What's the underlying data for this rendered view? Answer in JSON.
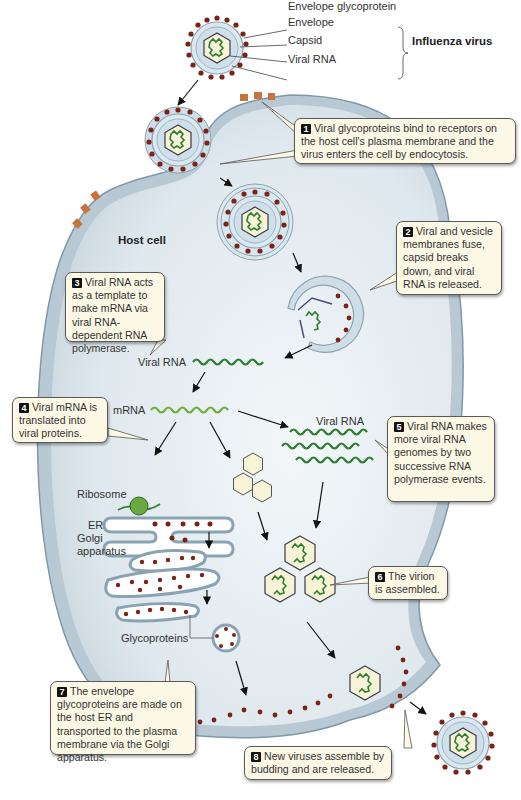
{
  "virus_legend": {
    "parts": [
      "Envelope glycoprotein",
      "Envelope",
      "Capsid",
      "Viral RNA"
    ],
    "group_label": "Influenza virus"
  },
  "labels": {
    "host_cell": "Host cell",
    "viral_rna_1": "Viral RNA",
    "mrna": "mRNA",
    "viral_rna_2": "Viral RNA",
    "ribosome": "Ribosome",
    "er": "ER",
    "golgi_1": "Golgi",
    "golgi_2": "apparatus",
    "glycoproteins": "Glycoproteins"
  },
  "steps": [
    {
      "n": "1",
      "text": "Viral glycoproteins bind to receptors on the host cell's plasma membrane and the virus enters the cell by endocytosis."
    },
    {
      "n": "2",
      "text": "Viral and vesicle membranes fuse, capsid breaks down, and viral RNA is released."
    },
    {
      "n": "3",
      "text": "Viral RNA acts as a template to make mRNA via viral RNA-dependent RNA polymerase."
    },
    {
      "n": "4",
      "text": "Viral mRNA is translated into viral proteins."
    },
    {
      "n": "5",
      "text": "Viral RNA makes more viral RNA genomes by two successive RNA polymerase events."
    },
    {
      "n": "6",
      "text": "The virion is assembled."
    },
    {
      "n": "7",
      "text": "The envelope glycoproteins are made on the host ER and transported to the plasma membrane via the Golgi apparatus."
    },
    {
      "n": "8",
      "text": "New viruses assemble by budding and are released."
    }
  ],
  "colors": {
    "cell_fill": "#b9c9d3",
    "cytoplasm": "#e6eef3",
    "glycoprotein": "#7a2418",
    "rna": "#2e7d32",
    "mrna": "#6fae3c",
    "capsid_fill": "#f6f3d6",
    "callout_fill": "#fbf8e6"
  }
}
